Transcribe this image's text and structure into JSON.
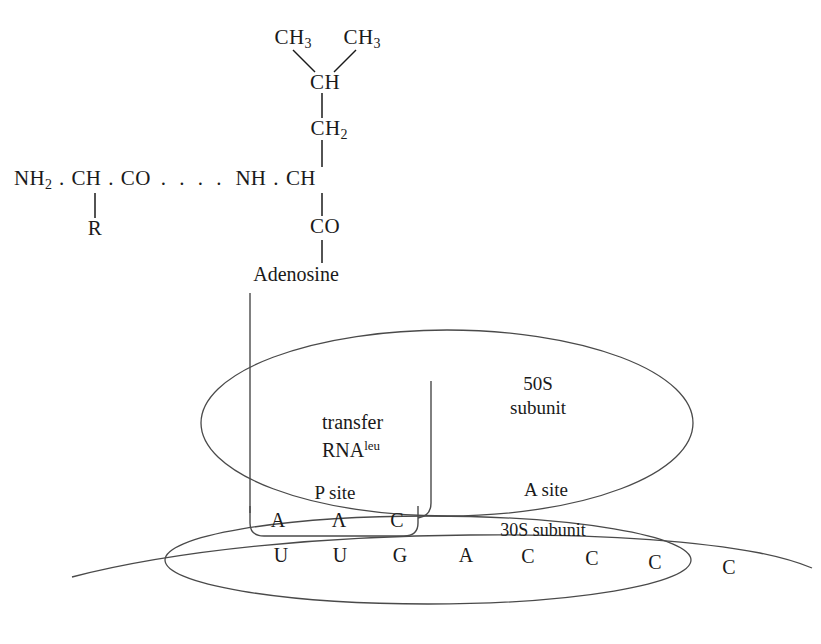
{
  "figure": {
    "kind": "ribosome-translation-diagram",
    "background_color": "#ffffff",
    "ink_color": "#1a1a1a"
  },
  "peptide_chain": {
    "nh2": "NH",
    "nh2_sub": "2",
    "dot1": ".",
    "ch_alpha": "CH",
    "dot2": ".",
    "co": "CO",
    "ellipsis": ". . . .",
    "nh": "NH",
    "dot3": ".",
    "ch_beta": "CH",
    "side_chain_r": "R"
  },
  "leucine_side_chain": {
    "methyl_left": "CH",
    "methyl_left_sub": "3",
    "methyl_right": "CH",
    "methyl_right_sub": "3",
    "methine": "CH",
    "methylene": "CH",
    "methylene_sub": "2",
    "carbonyl": "CO",
    "adenosine": "Adenosine"
  },
  "ribosome": {
    "large_subunit_line1": "50S",
    "large_subunit_line2": "subunit",
    "small_subunit": "30S subunit",
    "p_site": "P site",
    "a_site": "A site",
    "trna_line1": "transfer",
    "trna_line2": "RNA",
    "trna_superscript": "leu"
  },
  "anticodon": {
    "bases": [
      "A",
      "Λ",
      "C"
    ]
  },
  "mrna": {
    "bases_inside": [
      "U",
      "U",
      "G",
      "A",
      "C",
      "C",
      "C"
    ],
    "bases_outside": [
      "C"
    ]
  }
}
